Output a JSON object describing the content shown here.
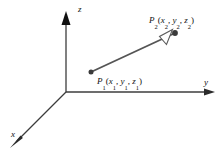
{
  "figure": {
    "background_color": "#ffffff",
    "axis_color": "#3c3c3c",
    "vector_color": "#555555",
    "point_color": "#3a3a3a",
    "arrowhead_fill": "#ffffff",
    "arrowhead_stroke": "#5a5a5a"
  },
  "axes": {
    "origin": {
      "x": 66,
      "y": 92
    },
    "items": [
      {
        "name": "z-axis",
        "label": "z",
        "label_x": 78,
        "label_y": 12,
        "from": {
          "x": 66,
          "y": 92
        },
        "to": {
          "x": 66,
          "y": 14
        },
        "arrow": "solid-triangle"
      },
      {
        "name": "y-axis",
        "label": "y",
        "label_x": 205,
        "label_y": 85,
        "from": {
          "x": 66,
          "y": 92
        },
        "to": {
          "x": 214,
          "y": 92
        },
        "arrow": "thin-open"
      },
      {
        "name": "x-axis",
        "label": "x",
        "label_x": 12,
        "label_y": 137,
        "from": {
          "x": 66,
          "y": 92
        },
        "to": {
          "x": 11,
          "y": 147
        },
        "arrow": "thin-open"
      }
    ]
  },
  "vector": {
    "name": "segment-p1-p2",
    "start": {
      "x": 91,
      "y": 72
    },
    "end": {
      "x": 175,
      "y": 33
    },
    "arrowhead_at": {
      "x": 166,
      "y": 38
    },
    "stroke_width": 1.8
  },
  "points": [
    {
      "id": "P1",
      "dot": {
        "x": 91,
        "y": 72
      },
      "label_x": 97,
      "label_y": 83,
      "label_parts": [
        {
          "text": "P",
          "type": "italic"
        },
        {
          "text": "1",
          "type": "sub"
        },
        {
          "text": "(",
          "type": "roman"
        },
        {
          "text": "x",
          "type": "italic"
        },
        {
          "text": "1",
          "type": "sub"
        },
        {
          "text": ", ",
          "type": "roman"
        },
        {
          "text": "y",
          "type": "italic"
        },
        {
          "text": "1",
          "type": "sub"
        },
        {
          "text": ", ",
          "type": "roman"
        },
        {
          "text": "z",
          "type": "italic"
        },
        {
          "text": "1",
          "type": "sub"
        },
        {
          "text": ")",
          "type": "roman"
        }
      ],
      "label_plain": "P1(x1, y1, z1)"
    },
    {
      "id": "P2",
      "dot": {
        "x": 175,
        "y": 33
      },
      "label_x": 149,
      "label_y": 23,
      "label_parts": [
        {
          "text": "P",
          "type": "italic"
        },
        {
          "text": "2",
          "type": "sub"
        },
        {
          "text": "(",
          "type": "roman"
        },
        {
          "text": "x",
          "type": "italic"
        },
        {
          "text": "2",
          "type": "sub"
        },
        {
          "text": ", ",
          "type": "roman"
        },
        {
          "text": "y",
          "type": "italic"
        },
        {
          "text": "2",
          "type": "sub"
        },
        {
          "text": ", ",
          "type": "roman"
        },
        {
          "text": "z",
          "type": "italic"
        },
        {
          "text": "2",
          "type": "sub"
        },
        {
          "text": ")",
          "type": "roman"
        }
      ],
      "label_plain": "P2(x2, y2, z2)"
    }
  ]
}
